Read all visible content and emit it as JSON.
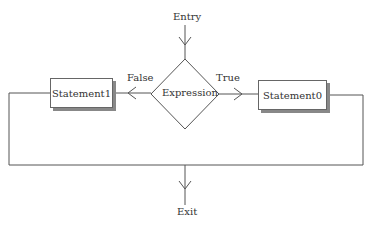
{
  "diagram": {
    "entry_label": "Entry",
    "exit_label": "Exit",
    "decision": {
      "label": "Expression"
    },
    "true_label": "True",
    "false_label": "False",
    "statement_true": {
      "label": "Statement0"
    },
    "statement_false": {
      "label": "Statement1"
    }
  },
  "colors": {
    "line": "#555555",
    "shadow": "#888888",
    "background": "#ffffff"
  }
}
